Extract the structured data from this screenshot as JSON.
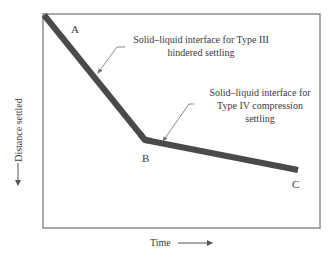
{
  "diagram": {
    "axes": {
      "x_label": "Time",
      "y_label": "Distance settled"
    },
    "points": {
      "A": "A",
      "B": "B",
      "C": "C"
    },
    "annotations": [
      {
        "id": "type3",
        "lines": [
          "Solid–liquid interface for Type III",
          "hindered settling"
        ],
        "target_segment": "A-B"
      },
      {
        "id": "type4",
        "lines": [
          "Solid–liquid interface for",
          "Type IV compression",
          "settling"
        ],
        "target_segment": "B-C"
      }
    ],
    "colors": {
      "curve": "#4a4a4a",
      "frame": "#8c8c8c",
      "text": "#3a3a3a",
      "leader": "#7a7a7a"
    }
  }
}
